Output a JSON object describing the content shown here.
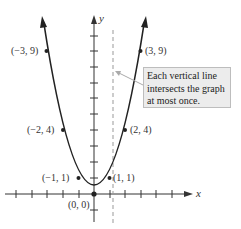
{
  "graph": {
    "x_axis_label": "x",
    "y_axis_label": "y",
    "curve": "y = x^2",
    "points": [
      {
        "label": "(−3, 9)",
        "x": -3,
        "y": 9
      },
      {
        "label": "(3, 9)",
        "x": 3,
        "y": 9
      },
      {
        "label": "(−2, 4)",
        "x": -2,
        "y": 4
      },
      {
        "label": "(2, 4)",
        "x": 2,
        "y": 4
      },
      {
        "label": "(−1, 1)",
        "x": -1,
        "y": 1
      },
      {
        "label": "(1, 1)",
        "x": 1,
        "y": 1
      },
      {
        "label": "(0, 0)",
        "x": 0,
        "y": 0
      }
    ],
    "dashed_line_x": 1.2,
    "callout_text": "Each vertical line intersects the graph at most once.",
    "colors": {
      "curve": "#222222",
      "axis": "#333333",
      "dashed": "#999999",
      "callout_bg": "#ececec"
    }
  }
}
